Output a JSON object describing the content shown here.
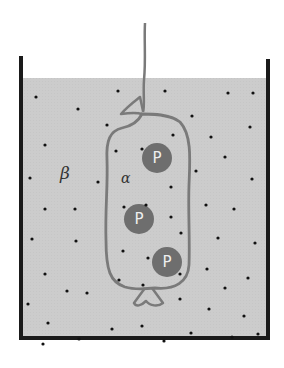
{
  "diagram": {
    "labels": {
      "outer_solution": "β",
      "inner_solution": "α",
      "protein": "P"
    },
    "colors": {
      "solution_fill": "#cbcbcb",
      "container_walls": "#1a1a1a",
      "membrane_bag": "#7a7a7a",
      "protein_fill": "#6e6e6e",
      "protein_text": "#eeeeee",
      "small_particles": "#111111"
    },
    "proteins": [
      {
        "cx": 157,
        "cy": 158,
        "r": 15
      },
      {
        "cx": 139,
        "cy": 219,
        "r": 15
      },
      {
        "cx": 167,
        "cy": 262,
        "r": 15
      }
    ],
    "small_particles": [
      [
        36,
        97
      ],
      [
        118,
        91
      ],
      [
        165,
        91
      ],
      [
        228,
        93
      ],
      [
        253,
        93
      ],
      [
        78,
        109
      ],
      [
        192,
        116
      ],
      [
        107,
        125
      ],
      [
        173,
        135
      ],
      [
        250,
        127
      ],
      [
        211,
        137
      ],
      [
        45,
        145
      ],
      [
        116,
        151
      ],
      [
        142,
        149
      ],
      [
        225,
        157
      ],
      [
        196,
        171
      ],
      [
        30,
        178
      ],
      [
        98,
        182
      ],
      [
        252,
        179
      ],
      [
        45,
        209
      ],
      [
        75,
        209
      ],
      [
        124,
        207
      ],
      [
        146,
        205
      ],
      [
        171,
        187
      ],
      [
        206,
        205
      ],
      [
        234,
        209
      ],
      [
        171,
        217
      ],
      [
        181,
        233
      ],
      [
        32,
        239
      ],
      [
        76,
        241
      ],
      [
        218,
        238
      ],
      [
        123,
        251
      ],
      [
        148,
        258
      ],
      [
        255,
        243
      ],
      [
        45,
        274
      ],
      [
        180,
        274
      ],
      [
        207,
        269
      ],
      [
        248,
        278
      ],
      [
        67,
        291
      ],
      [
        87,
        293
      ],
      [
        119,
        280
      ],
      [
        143,
        285
      ],
      [
        225,
        288
      ],
      [
        180,
        299
      ],
      [
        28,
        304
      ],
      [
        209,
        309
      ],
      [
        244,
        316
      ],
      [
        48,
        323
      ],
      [
        112,
        329
      ],
      [
        142,
        326
      ],
      [
        79,
        339
      ],
      [
        191,
        333
      ],
      [
        232,
        337
      ],
      [
        43,
        344
      ],
      [
        164,
        341
      ],
      [
        258,
        334
      ]
    ]
  }
}
